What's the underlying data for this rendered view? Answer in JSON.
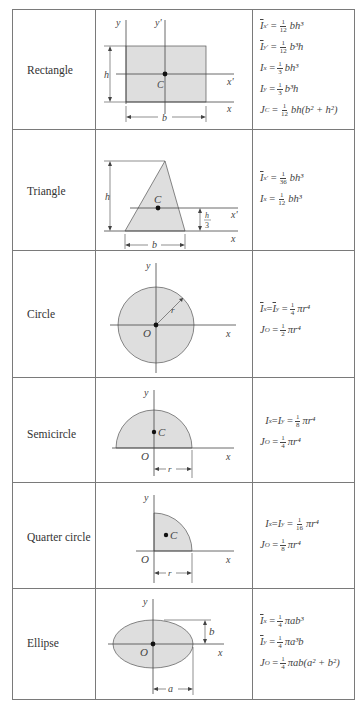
{
  "table": {
    "rows": [
      {
        "shape": "Rectangle",
        "labels": {
          "y": "y",
          "y_prime": "y'",
          "x": "x",
          "x_prime": "x'",
          "centroid": "C",
          "height": "h",
          "base": "b"
        },
        "formulas": [
          {
            "lhs_sym": "I",
            "lhs_sub": "x'",
            "bar": true,
            "num": "1",
            "den": "12",
            "rhs": "bh³"
          },
          {
            "lhs_sym": "I",
            "lhs_sub": "y'",
            "bar": true,
            "num": "1",
            "den": "12",
            "rhs": "b³h"
          },
          {
            "lhs_sym": "I",
            "lhs_sub": "x",
            "bar": false,
            "num": "1",
            "den": "3",
            "rhs": "bh³"
          },
          {
            "lhs_sym": "I",
            "lhs_sub": "y",
            "bar": false,
            "num": "1",
            "den": "3",
            "rhs": "b³h"
          },
          {
            "lhs_sym": "J",
            "lhs_sub": "C",
            "bar": false,
            "num": "1",
            "den": "12",
            "rhs": "bh(b² + h²)"
          }
        ]
      },
      {
        "shape": "Triangle",
        "labels": {
          "x": "x",
          "x_prime": "x'",
          "centroid": "C",
          "height": "h",
          "base": "b",
          "h_third_num": "h",
          "h_third_den": "3"
        },
        "formulas": [
          {
            "lhs_sym": "I",
            "lhs_sub": "x'",
            "bar": true,
            "num": "1",
            "den": "36",
            "rhs": "bh³"
          },
          {
            "lhs_sym": "I",
            "lhs_sub": "x",
            "bar": false,
            "num": "1",
            "den": "12",
            "rhs": "bh³"
          }
        ]
      },
      {
        "shape": "Circle",
        "labels": {
          "y": "y",
          "x": "x",
          "origin": "O",
          "radius": "r"
        },
        "formulas": [
          {
            "text_pre": "I",
            "sub1": "x",
            "mid": " = ",
            "sym2": "I",
            "sub2": "y",
            "bar": true,
            "num": "1",
            "den": "4",
            "rhs": "πr⁴"
          },
          {
            "lhs_sym": "J",
            "lhs_sub": "O",
            "bar": false,
            "num": "1",
            "den": "2",
            "rhs": "πr⁴"
          }
        ]
      },
      {
        "shape": "Semicircle",
        "labels": {
          "y": "y",
          "x": "x",
          "origin": "O",
          "centroid": "C",
          "radius": "r"
        },
        "formulas": [
          {
            "text_pre": "I",
            "sub1": "x",
            "mid": " = ",
            "sym2": "I",
            "sub2": "y",
            "bar": false,
            "num": "1",
            "den": "8",
            "rhs": "πr⁴"
          },
          {
            "lhs_sym": "J",
            "lhs_sub": "O",
            "bar": false,
            "num": "1",
            "den": "4",
            "rhs": "πr⁴"
          }
        ]
      },
      {
        "shape": "Quarter circle",
        "labels": {
          "y": "y",
          "x": "x",
          "origin": "O",
          "centroid": "C",
          "radius": "r"
        },
        "formulas": [
          {
            "text_pre": "I",
            "sub1": "x",
            "mid": " = ",
            "sym2": "I",
            "sub2": "y",
            "bar": false,
            "num": "1",
            "den": "16",
            "rhs": "πr⁴"
          },
          {
            "lhs_sym": "J",
            "lhs_sub": "O",
            "bar": false,
            "num": "1",
            "den": "8",
            "rhs": "πr⁴"
          }
        ]
      },
      {
        "shape": "Ellipse",
        "labels": {
          "y": "y",
          "x": "x",
          "origin": "O",
          "semi_major": "a",
          "semi_minor": "b"
        },
        "formulas": [
          {
            "lhs_sym": "I",
            "lhs_sub": "x",
            "bar": true,
            "num": "1",
            "den": "4",
            "rhs": "πab³"
          },
          {
            "lhs_sym": "I",
            "lhs_sub": "y",
            "bar": true,
            "num": "1",
            "den": "4",
            "rhs": "πa³b"
          },
          {
            "lhs_sym": "J",
            "lhs_sub": "O",
            "bar": false,
            "num": "1",
            "den": "4",
            "rhs": "πab(a² + b²)"
          }
        ]
      }
    ]
  },
  "colors": {
    "fill": "#dedede",
    "stroke": "#444444",
    "border": "#7a7a7a"
  }
}
